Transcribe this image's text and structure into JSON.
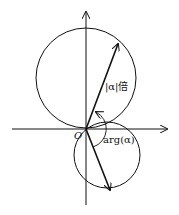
{
  "diagram": {
    "origin_label": "O",
    "magnitude_label": "|α|倍",
    "argument_label": "arg(α)",
    "stroke_color": "#111111",
    "background_color": "#ffffff"
  }
}
